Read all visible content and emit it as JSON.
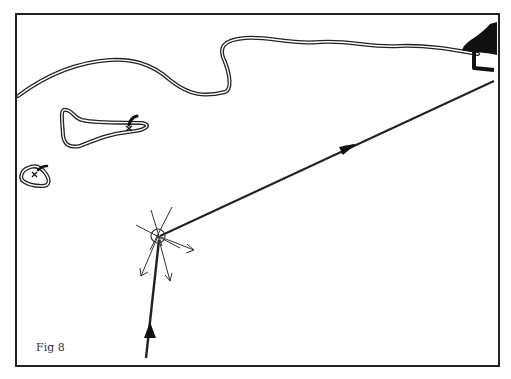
{
  "figure": {
    "caption": "Fig 8",
    "colors": {
      "ink": "#222222",
      "paper": "#ffffff"
    },
    "elements": {
      "frame": "rectangular border",
      "coastline": "double-line shoreline across top",
      "island_large": "elongated island with small marker (x)",
      "island_small": "small island with marker (x)",
      "headland": "solid black landmass top-right with jetty",
      "incoming_ray": "arrow from bottom pointing up to impact point",
      "outgoing_ray": "arrow from impact point to upper right",
      "impact_point": "small circle with radiating scatter lines and arrows"
    }
  }
}
